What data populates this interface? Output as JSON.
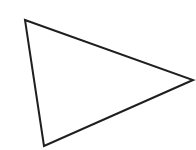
{
  "canvas": {
    "width": 196,
    "height": 150,
    "background_color": "#ffffff",
    "name": "white-canvas"
  },
  "figure": {
    "name": "triangle-outline",
    "shape_type": "triangle",
    "orientation": "right-pointing",
    "fill_color": "#ffffff",
    "stroke_color": "#1f1f1f",
    "stroke_width": 2,
    "stroke_linejoin": "miter",
    "caption": "",
    "points_attr": "25,20 193,80 44,146",
    "vertices": [
      {
        "label": "top-left-vertex",
        "x": 25,
        "y": 20
      },
      {
        "label": "right-vertex",
        "x": 193,
        "y": 80
      },
      {
        "label": "bottom-left-vertex",
        "x": 44,
        "y": 146
      }
    ],
    "edges": [
      {
        "label": "top-edge",
        "from": "top-left-vertex",
        "to": "right-vertex"
      },
      {
        "label": "bottom-edge",
        "from": "right-vertex",
        "to": "bottom-left-vertex"
      },
      {
        "label": "left-edge",
        "from": "bottom-left-vertex",
        "to": "top-left-vertex"
      }
    ]
  }
}
